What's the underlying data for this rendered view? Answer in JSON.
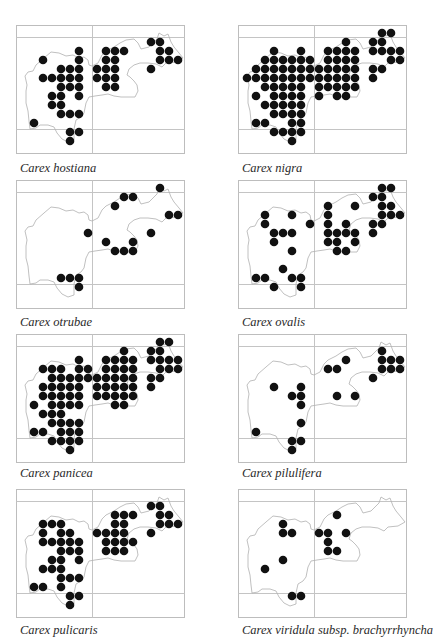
{
  "figure": {
    "grid": {
      "frame_width": 168,
      "frame_height": 128,
      "grid_lines": {
        "horizontal_y": [
          12,
          104
        ],
        "vertical_x": [
          76
        ]
      },
      "dot_origin_x": 18,
      "dot_origin_y": 17,
      "dot_spacing": 9,
      "dot_radius": 4.3,
      "colors": {
        "dot": "#111111",
        "frame": "#bdbdbd",
        "grid_line": "#c4c4c4",
        "outline": "#b0b0b0"
      }
    },
    "maps": [
      {
        "species": "Carex hostiana",
        "dots": {
          "0": [
            13,
            14
          ],
          "1": [
            5,
            8,
            9,
            10,
            14,
            15
          ],
          "2": [
            1,
            5,
            8,
            9,
            14,
            15,
            16
          ],
          "3": [
            3,
            4,
            5,
            7,
            8,
            9,
            13
          ],
          "4": [
            1,
            2,
            3,
            4,
            5,
            7,
            8,
            9
          ],
          "5": [
            3,
            4,
            5,
            8,
            9
          ],
          "6": [
            2,
            3,
            5
          ],
          "7": [
            2,
            3
          ],
          "8": [
            3,
            4,
            5
          ],
          "9": [
            0
          ],
          "10": [
            4,
            5
          ],
          "11": [
            4
          ]
        }
      },
      {
        "species": "Carex nigra",
        "dots": {
          "-1": [
            14,
            15
          ],
          "0": [
            10,
            13,
            14
          ],
          "1": [
            2,
            5,
            8,
            9,
            10,
            11,
            13,
            14,
            15,
            16
          ],
          "2": [
            1,
            2,
            3,
            4,
            5,
            6,
            8,
            9,
            10,
            11,
            15,
            16
          ],
          "3": [
            0,
            1,
            2,
            3,
            4,
            5,
            6,
            7,
            8,
            9,
            10,
            11,
            13,
            14
          ],
          "4": [
            -1,
            0,
            1,
            2,
            3,
            4,
            5,
            6,
            7,
            8,
            9,
            10,
            11,
            13
          ],
          "5": [
            1,
            2,
            3,
            4,
            5,
            7,
            8,
            9,
            10,
            11
          ],
          "6": [
            0,
            2,
            3,
            4,
            5,
            7,
            9,
            10
          ],
          "7": [
            1,
            2,
            3,
            4,
            5
          ],
          "8": [
            2,
            3,
            4,
            5
          ],
          "9": [
            0,
            1,
            4,
            5
          ],
          "10": [
            2,
            3,
            4,
            5
          ],
          "11": [
            4
          ]
        }
      },
      {
        "species": "Carex otrubae",
        "dots": {
          "-1": [
            14
          ],
          "0": [
            10,
            11
          ],
          "1": [
            9
          ],
          "2": [
            15,
            16
          ],
          "4": [
            6,
            13
          ],
          "5": [
            8,
            11
          ],
          "6": [
            9,
            10,
            11
          ],
          "9": [
            3,
            4,
            5
          ],
          "10": [
            5
          ]
        }
      },
      {
        "species": "Carex ovalis",
        "dots": {
          "-1": [
            14,
            15
          ],
          "0": [
            13,
            14
          ],
          "1": [
            8,
            11,
            14,
            15
          ],
          "2": [
            1,
            4,
            8,
            14,
            15,
            16
          ],
          "3": [
            1,
            6,
            8,
            10,
            13,
            14
          ],
          "4": [
            2,
            3,
            4,
            8,
            9,
            10,
            11,
            13
          ],
          "5": [
            2,
            8,
            9,
            11
          ],
          "6": [
            4,
            9,
            10
          ],
          "8": [
            3
          ],
          "9": [
            0,
            1,
            4,
            5
          ],
          "10": [
            2,
            5
          ]
        }
      },
      {
        "species": "Carex panicea",
        "dots": {
          "-1": [
            14,
            15
          ],
          "0": [
            10,
            13,
            14
          ],
          "1": [
            5,
            8,
            9,
            10,
            11,
            13,
            14,
            15,
            16
          ],
          "2": [
            1,
            2,
            3,
            5,
            6,
            8,
            9,
            10,
            11,
            14,
            15,
            16
          ],
          "3": [
            2,
            3,
            4,
            5,
            6,
            7,
            8,
            9,
            10,
            11,
            13,
            14
          ],
          "4": [
            1,
            2,
            3,
            4,
            5,
            7,
            8,
            9,
            10,
            11,
            13
          ],
          "5": [
            1,
            2,
            3,
            4,
            5,
            7,
            8,
            9,
            10,
            11
          ],
          "6": [
            0,
            2,
            3,
            4,
            5,
            9,
            10
          ],
          "7": [
            1,
            2,
            3
          ],
          "8": [
            2,
            3,
            4,
            5
          ],
          "9": [
            0,
            1,
            3,
            4,
            5
          ],
          "10": [
            2,
            3,
            4,
            5
          ],
          "11": [
            4
          ]
        }
      },
      {
        "species": "Carex pilulifera",
        "dots": {
          "0": [
            14
          ],
          "1": [
            10,
            14,
            15,
            16
          ],
          "2": [
            8,
            9,
            14,
            15,
            16
          ],
          "3": [
            13
          ],
          "4": [
            2,
            5
          ],
          "5": [
            4,
            5,
            9,
            11
          ],
          "6": [
            5
          ],
          "8": [
            5
          ],
          "9": [
            0
          ],
          "10": [
            4,
            5
          ],
          "11": [
            4
          ]
        }
      },
      {
        "species": "Carex pulicaris",
        "dots": {
          "0": [
            13,
            14
          ],
          "1": [
            9,
            10,
            11,
            14,
            15
          ],
          "2": [
            1,
            2,
            3,
            9,
            10,
            14,
            15,
            16
          ],
          "3": [
            1,
            3,
            4,
            7,
            8,
            9,
            10,
            13
          ],
          "4": [
            1,
            2,
            3,
            4,
            5,
            8,
            9,
            10,
            11
          ],
          "5": [
            3,
            4,
            5,
            8,
            9,
            10
          ],
          "6": [
            2,
            3,
            5
          ],
          "7": [
            1,
            2,
            3
          ],
          "8": [
            3,
            4,
            5
          ],
          "9": [
            0,
            1,
            3
          ],
          "10": [
            4,
            5
          ],
          "11": [
            4
          ]
        }
      },
      {
        "species": "Carex viridula subsp. brachyrrhyncha",
        "dots": {
          "1": [
            9
          ],
          "2": [
            3
          ],
          "3": [
            3,
            4,
            7,
            8,
            10
          ],
          "4": [
            8
          ],
          "5": [
            8,
            9
          ],
          "6": [
            3
          ],
          "7": [
            1
          ],
          "10": [
            4,
            5
          ]
        }
      }
    ]
  }
}
